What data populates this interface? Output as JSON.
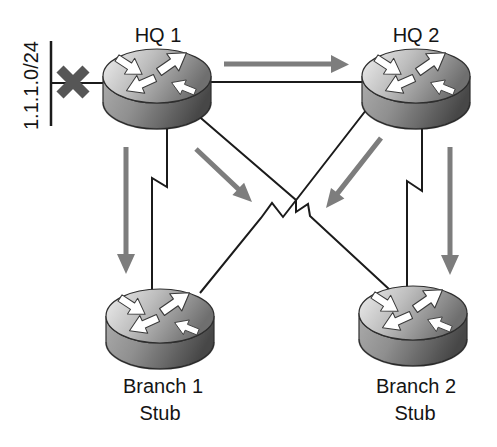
{
  "diagram": {
    "type": "network-topology",
    "network_label": "1.1.1.0/24",
    "nodes": [
      {
        "id": "hq1",
        "label": "HQ 1",
        "icon": "router-icon"
      },
      {
        "id": "hq2",
        "label": "HQ 2",
        "icon": "router-icon"
      },
      {
        "id": "branch1",
        "label": "Branch 1",
        "sublabel": "Stub",
        "icon": "router-icon"
      },
      {
        "id": "branch2",
        "label": "Branch 2",
        "sublabel": "Stub",
        "icon": "router-icon"
      }
    ],
    "links": [
      {
        "from": "1.1.1.0/24",
        "to": "hq1",
        "style": "straight",
        "status": "blocked"
      },
      {
        "from": "hq1",
        "to": "hq2",
        "style": "straight"
      },
      {
        "from": "hq1",
        "to": "branch1",
        "style": "lightning-bolt"
      },
      {
        "from": "hq1",
        "to": "branch2",
        "style": "lightning-bolt"
      },
      {
        "from": "hq2",
        "to": "branch1",
        "style": "lightning-bolt"
      },
      {
        "from": "hq2",
        "to": "branch2",
        "style": "lightning-bolt"
      }
    ],
    "flow_arrows": [
      {
        "from": "hq1",
        "to": "hq2",
        "direction": "right"
      },
      {
        "from": "hq1",
        "to": "branch1",
        "direction": "down"
      },
      {
        "from": "hq1",
        "to": "branch2",
        "direction": "down-right"
      },
      {
        "from": "hq2",
        "to": "branch1",
        "direction": "down-left"
      },
      {
        "from": "hq2",
        "to": "branch2",
        "direction": "down"
      }
    ],
    "colors": {
      "flow_arrow": "#7d7d7d",
      "link_line": "#1b1b1b",
      "blocked_cross": "#565656",
      "label_text": "#141414",
      "background": "#ffffff"
    }
  }
}
